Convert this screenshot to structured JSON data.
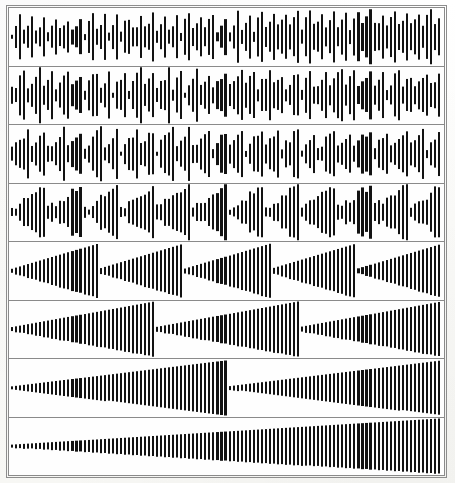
{
  "figure": {
    "panel_count": 8,
    "background_color": "#fdfdfb",
    "bar_color": "#121212",
    "frame_color": "#8d8d8d",
    "panel_border_color": "#8a8a8a"
  },
  "chart_data": {
    "type": "bar",
    "subtitle": "Eight stacked panels; envelope modulation rate decreases from top to bottom",
    "xlabel": "",
    "ylabel": "",
    "grid": false,
    "legend": null,
    "x_range": [
      0,
      107
    ],
    "y_range": [
      -1,
      1
    ],
    "bars_per_panel": 107,
    "bar_width_px": 2,
    "bar_pitch_px": 4,
    "rendering": "each bar drawn symmetrically about the panel mid-line (vertical centre)",
    "panels": [
      {
        "index": 1,
        "name": "panel-1",
        "envelope": "sawtooth-ramp",
        "cycles": 36,
        "min_amplitude": 0.16,
        "max_amplitude": 0.92,
        "description": "Very fast modulation; appears as dense random-looking spiky waveform"
      },
      {
        "index": 2,
        "name": "panel-2",
        "envelope": "sawtooth-ramp",
        "cycles": 30,
        "min_amplitude": 0.16,
        "max_amplitude": 0.94,
        "description": "Fast modulation, slightly wider spike groups than panel 1"
      },
      {
        "index": 3,
        "name": "panel-3",
        "envelope": "sawtooth-ramp",
        "cycles": 24,
        "min_amplitude": 0.14,
        "max_amplitude": 0.96,
        "description": "Visible short ramp groups of about 4-5 bars each"
      },
      {
        "index": 4,
        "name": "panel-4",
        "envelope": "sawtooth-ramp",
        "cycles": 12,
        "min_amplitude": 0.1,
        "max_amplitude": 0.97,
        "description": "Clear triangular ramp groups of about 9 bars each"
      },
      {
        "index": 5,
        "name": "panel-5",
        "envelope": "sawtooth-ramp",
        "cycles": 5,
        "min_amplitude": 0.08,
        "max_amplitude": 0.99,
        "description": "Five long ramps rising from near zero to full height"
      },
      {
        "index": 6,
        "name": "panel-6",
        "envelope": "sawtooth-ramp",
        "cycles": 3,
        "min_amplitude": 0.07,
        "max_amplitude": 1.0,
        "description": "Three long ramps across the panel width"
      },
      {
        "index": 7,
        "name": "panel-7",
        "envelope": "sawtooth-ramp",
        "cycles": 2,
        "min_amplitude": 0.06,
        "max_amplitude": 1.0,
        "description": "Two long ramps; first occupies about four fifths of the width"
      },
      {
        "index": 8,
        "name": "panel-8",
        "envelope": "sawtooth-ramp",
        "cycles": 1,
        "min_amplitude": 0.05,
        "max_amplitude": 1.0,
        "description": "Single slow ramp spanning the entire panel width"
      }
    ]
  }
}
